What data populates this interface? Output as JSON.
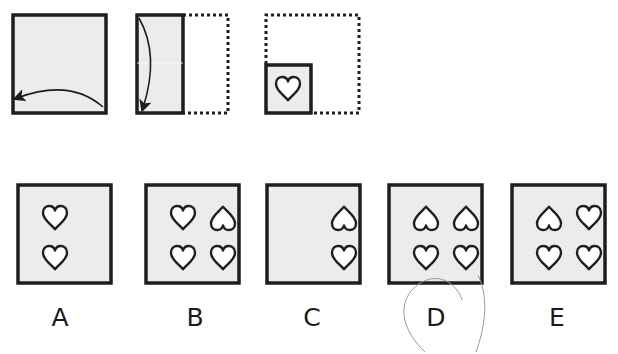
{
  "puzzle": {
    "type": "paper-folding",
    "question_marker": "",
    "steps": [
      {
        "id": "step-1",
        "description": "unfolded square; fold right half onto left",
        "arrow": "right-to-left"
      },
      {
        "id": "step-2",
        "description": "half-width rectangle; fold top onto bottom",
        "arrow": "top-to-bottom"
      },
      {
        "id": "step-3",
        "description": "quarter square with heart punched",
        "punch": "heart"
      }
    ],
    "options": [
      {
        "label": "A",
        "hearts": [
          "up-inverted",
          "up"
        ],
        "columns": [
          "left"
        ],
        "selected": false
      },
      {
        "label": "B",
        "hearts": [
          "up",
          "inverted",
          "up",
          "up"
        ],
        "columns": [
          "left",
          "right"
        ],
        "selected": false
      },
      {
        "label": "C",
        "hearts": [
          "inverted",
          "up"
        ],
        "columns": [
          "right"
        ],
        "selected": false
      },
      {
        "label": "D",
        "hearts": [
          "inverted",
          "inverted",
          "up",
          "up"
        ],
        "columns": [
          "left",
          "right"
        ],
        "selected": true
      },
      {
        "label": "E",
        "hearts": [
          "inverted",
          "up",
          "up",
          "up"
        ],
        "columns": [
          "left",
          "right"
        ],
        "selected": false
      }
    ],
    "selected_answer": "D"
  },
  "colors": {
    "stroke": "#1e1e1e",
    "paper": "#ececec",
    "heart_fill": "#ffffff",
    "pencil": "#9a9a9a"
  }
}
